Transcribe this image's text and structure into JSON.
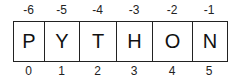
{
  "diagram": {
    "letters": [
      "P",
      "Y",
      "T",
      "H",
      "O",
      "N"
    ],
    "negative_indices": [
      "-6",
      "-5",
      "-4",
      "-3",
      "-2",
      "-1"
    ],
    "positive_indices": [
      "0",
      "1",
      "2",
      "3",
      "4",
      "5"
    ],
    "widths": [
      31,
      35,
      37,
      36,
      40,
      34
    ]
  }
}
